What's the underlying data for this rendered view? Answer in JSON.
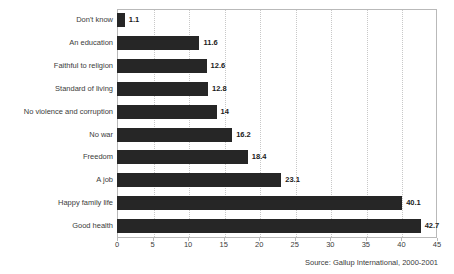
{
  "chart_data": {
    "type": "bar",
    "orientation": "horizontal",
    "title": "",
    "xlabel": "",
    "ylabel": "",
    "categories": [
      "Don't know",
      "An education",
      "Faithful to religion",
      "Standard of living",
      "No violence and corruption",
      "No war",
      "Freedom",
      "A job",
      "Happy family life",
      "Good health"
    ],
    "values": [
      1.1,
      11.6,
      12.6,
      12.8,
      14,
      16.2,
      18.4,
      23.1,
      40.1,
      42.7
    ],
    "value_labels": [
      "1.1",
      "11.6",
      "12.6",
      "12.8",
      "14",
      "16.2",
      "18.4",
      "23.1",
      "40.1",
      "42.7"
    ],
    "xlim": [
      0,
      45
    ],
    "xticks": [
      0,
      5,
      10,
      15,
      20,
      25,
      30,
      35,
      40,
      45
    ],
    "xtick_labels": [
      "0",
      "5",
      "10",
      "15",
      "20",
      "25",
      "30",
      "35",
      "40",
      "45"
    ],
    "grid": "vertical-dotted",
    "legend": "none",
    "bar_color": "#262626",
    "grid_color": "#c8c8c8",
    "axis_color": "#b9b9b9",
    "text_color": "#3b3b3b"
  },
  "source": {
    "text": "Source: Gallup International, 2000-2001"
  }
}
